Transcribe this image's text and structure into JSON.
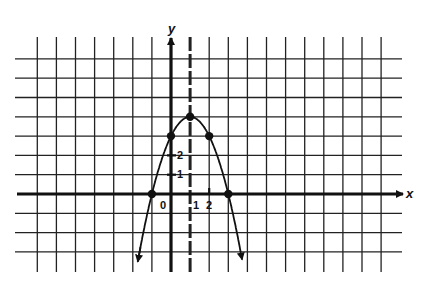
{
  "chart_data": {
    "type": "line",
    "title": "",
    "xlabel": "x",
    "ylabel": "y",
    "function": "y = -x^2 + 2x + 3",
    "axis_of_symmetry": "x = 1 (dashed vertical line)",
    "vertex": [
      1,
      4
    ],
    "points": [
      {
        "x": -1,
        "y": 0
      },
      {
        "x": 0,
        "y": 3
      },
      {
        "x": 1,
        "y": 4
      },
      {
        "x": 2,
        "y": 3
      },
      {
        "x": 3,
        "y": 0
      }
    ],
    "x_tick_labels": [
      "0",
      "1",
      "2"
    ],
    "y_tick_labels": [
      "1",
      "2"
    ],
    "grid": true,
    "grid_x_range": [
      -7,
      11
    ],
    "grid_y_range": [
      -4,
      7
    ],
    "arrows": "curve ends with arrowheads at both ends; axes have arrowheads in positive direction"
  },
  "labels": {
    "x_axis": "x",
    "y_axis": "y",
    "origin": "0",
    "x1": "1",
    "x2": "2",
    "y1": "1",
    "y2": "2"
  }
}
